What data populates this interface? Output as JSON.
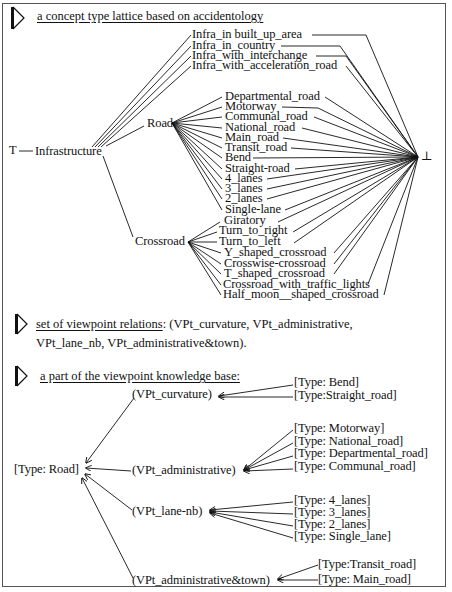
{
  "section1": {
    "heading": "a concept type lattice based on accidentology",
    "top_symbol": "T",
    "bottom_symbol": "⊥",
    "root": "Infrastructure",
    "infra_children": [
      "Infra_in built_up_area",
      "Infra_in_country",
      "Infra_with_interchange",
      "Infra_with_acceleration_road"
    ],
    "road": {
      "label": "Road",
      "children": [
        "Departmental_road",
        "Motorway",
        "Communal_road",
        "National_road",
        "Main_road",
        "Transit_road",
        "Bend",
        "Straight-road",
        "4_lanes",
        "3_lanes",
        "2_lanes",
        "Single-lane"
      ]
    },
    "crossroad": {
      "label": "Crossroad",
      "children": [
        "Giratory",
        "Turn_to_right",
        "Turn_to_left",
        "Y_shaped_crossroad",
        "Crosswise-crossroad",
        "T_shaped_crossroad",
        "Crossroad_with_traffic_lights",
        "Half_moon__shaped_crossroad"
      ]
    }
  },
  "section2": {
    "heading_underlined": " set of viewpoint relations",
    "heading_rest": ": (VPt_curvature, VPt_administrative,",
    "line2": "VPt_lane_nb, VPt_administrative&town)."
  },
  "section3": {
    "heading": "a part of the viewpoint knowledge base:",
    "root": "[Type: Road]",
    "viewpoints": [
      {
        "label": "(VPt_curvature)",
        "types": [
          "[Type: Bend]",
          "[Type:Straight_road]"
        ]
      },
      {
        "label": "(VPt_administrative)",
        "types": [
          "[Type: Motorway]",
          "[Type: National_road]",
          "[Type: Departmental_road]",
          "[Type: Communal_road]"
        ]
      },
      {
        "label": "(VPt_lane-nb)",
        "types": [
          "[Type: 4_lanes]",
          "[Type: 3_lanes]",
          "[Type: 2_lanes]",
          "[Type: Single_lane]"
        ]
      },
      {
        "label": "(VPt_administrative&town)",
        "types": [
          "[Type:Transit_road]",
          "[Type: Main_road]"
        ]
      }
    ]
  },
  "colors": {
    "line": "#111111",
    "frame": "#555555",
    "background": "#ffffff"
  }
}
